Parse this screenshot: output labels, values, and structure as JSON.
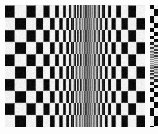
{
  "image": {
    "kind": "test-pattern",
    "title": "Checkerboard spatial-frequency sweep",
    "width": 158,
    "height": 134,
    "background_color": "#fdfdfd"
  },
  "palette": {
    "black": "#0b0b0b",
    "white": "#f2f2f2",
    "paper": "#fdfdfd",
    "halo": "#e3e3e3",
    "alias_gray_light": "#bdbdbd",
    "alias_gray_mid": "#8e8e8e",
    "alias_gray_dark": "#5a5a5a"
  },
  "main_panel": {
    "name": "checkerboard-sweep",
    "x": 5,
    "y": 5,
    "width": 140,
    "height": 122,
    "row_count": 10,
    "row_height": 12.2,
    "convergence_x": 89,
    "min_cell_width": 1.0,
    "max_cell_width_left": 16.0,
    "max_cell_width_right": 11.5,
    "alias_band": {
      "start_x": 78,
      "end_x": 100
    },
    "noise_amount": 0.055
  },
  "side_strip": {
    "name": "miniature-sweep-strip",
    "x": 150,
    "y": 5,
    "width": 8,
    "height": 122,
    "row_count": 10,
    "convergence_y": 62,
    "min_cell_height": 1.0,
    "max_cell_height": 11.0,
    "column_count": 2
  },
  "margins": {
    "left": 5,
    "top": 5,
    "right": 13,
    "bottom": 7,
    "gap_between_panels": 5
  }
}
